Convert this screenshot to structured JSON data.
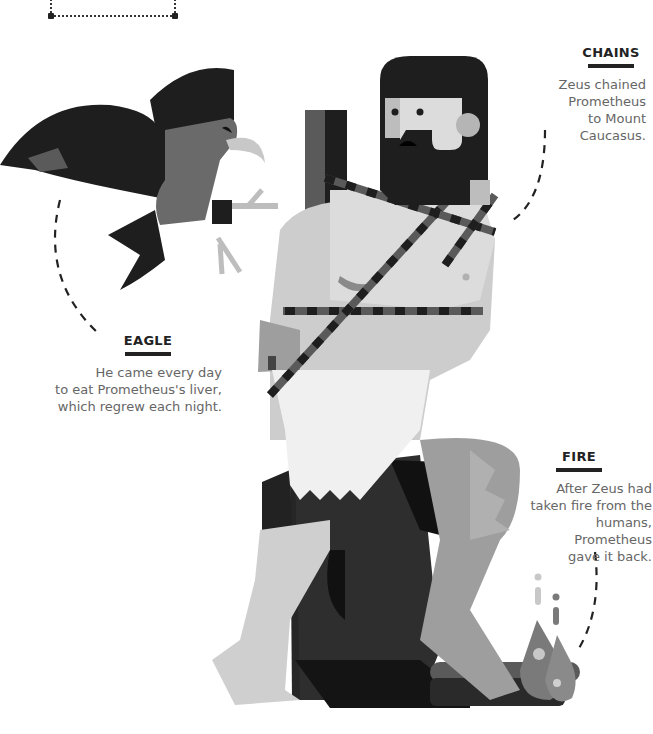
{
  "top_box": {
    "text": "benefactor."
  },
  "labels": {
    "chains": {
      "title": "CHAINS",
      "lines": [
        "Zeus chained",
        "Prometheus",
        "to Mount Caucasus."
      ]
    },
    "eagle": {
      "title": "EAGLE",
      "lines": [
        "He came every day",
        "to eat Prometheus's liver,",
        "which regrew each night."
      ]
    },
    "fire": {
      "title": "FIRE",
      "lines": [
        "After Zeus had",
        "taken fire from the",
        "humans, Prometheus",
        "gave it back."
      ]
    }
  },
  "illustration": {
    "subject": "Prometheus chained to a rock with an eagle",
    "elements": [
      "eagle-figure",
      "prometheus-figure",
      "chains",
      "rock",
      "fire-log"
    ]
  },
  "colors": {
    "black": "#1e1e1e",
    "dark_gray": "#3a3a3a",
    "mid_gray": "#6e6e6e",
    "skin": "#c8c8c8",
    "light": "#dcdcdc",
    "cloth": "#efefef",
    "text": "#666666",
    "title": "#222222"
  }
}
